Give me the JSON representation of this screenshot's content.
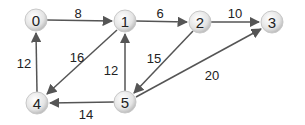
{
  "graph": {
    "type": "directed-weighted",
    "nodes": [
      {
        "id": "0",
        "label": "0",
        "x": 36,
        "y": 20
      },
      {
        "id": "1",
        "label": "1",
        "x": 125,
        "y": 21
      },
      {
        "id": "2",
        "label": "2",
        "x": 200,
        "y": 22
      },
      {
        "id": "3",
        "label": "3",
        "x": 272,
        "y": 22
      },
      {
        "id": "4",
        "label": "4",
        "x": 37,
        "y": 103
      },
      {
        "id": "5",
        "label": "5",
        "x": 125,
        "y": 102
      }
    ],
    "edges": [
      {
        "from": "0",
        "to": "1",
        "weight": "8"
      },
      {
        "from": "1",
        "to": "2",
        "weight": "6"
      },
      {
        "from": "2",
        "to": "3",
        "weight": "10"
      },
      {
        "from": "1",
        "to": "4",
        "weight": "16"
      },
      {
        "from": "4",
        "to": "0",
        "weight": "12"
      },
      {
        "from": "5",
        "to": "1",
        "weight": "12"
      },
      {
        "from": "2",
        "to": "5",
        "weight": "15"
      },
      {
        "from": "5",
        "to": "3",
        "weight": "20"
      },
      {
        "from": "5",
        "to": "4",
        "weight": "14"
      }
    ]
  }
}
